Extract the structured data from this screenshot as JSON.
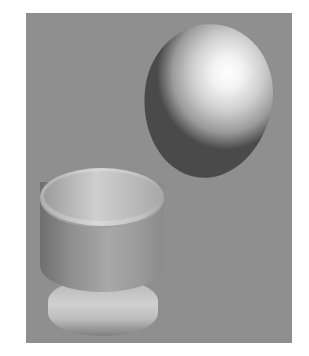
{
  "scene": {
    "description": "3D render of an egg floating above an egg cup on a gray background",
    "background_color": "#8f8f8f",
    "objects": [
      {
        "name": "egg",
        "color": "#e8e8e8"
      },
      {
        "name": "egg-cup",
        "color": "#a8a8a8"
      }
    ]
  }
}
